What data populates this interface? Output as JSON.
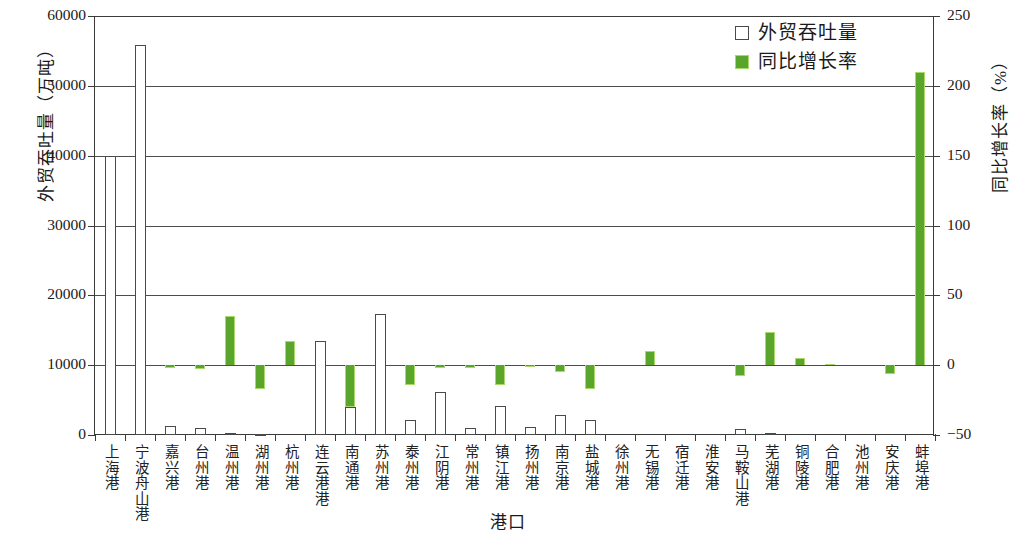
{
  "chart_data": {
    "type": "bar",
    "title": "",
    "xlabel": "港口",
    "ylabel": "外贸吞吐量（万吨）",
    "y2label": "同比增长率（%）",
    "ylim": [
      0,
      60000
    ],
    "y2lim": [
      -50,
      250
    ],
    "yticks": [
      "0",
      "10000",
      "20000",
      "30000",
      "40000",
      "50000",
      "60000"
    ],
    "y2ticks": [
      "-50",
      "0",
      "50",
      "100",
      "150",
      "200",
      "250"
    ],
    "grid": true,
    "legend_position": "top-right",
    "categories": [
      "上海港",
      "宁波舟山港",
      "嘉兴港",
      "台州港",
      "温州港",
      "湖州港",
      "杭州港",
      "连云港港",
      "南通港",
      "苏州港",
      "泰州港",
      "江阴港",
      "常州港",
      "镇江港",
      "扬州港",
      "南京港",
      "盐城港",
      "徐州港",
      "无锡港",
      "宿迁港",
      "淮安港",
      "马鞍山港",
      "芜湖港",
      "铜陵港",
      "合肥港",
      "池州港",
      "安庆港",
      "蚌埠港"
    ],
    "series": [
      {
        "name": "外贸吞吐量",
        "axis": "left",
        "unit": "万吨",
        "color": "#ffffff",
        "edge_color": "#4a4a4a",
        "values": [
          40000,
          55800,
          1300,
          1000,
          300,
          100,
          0,
          13500,
          4000,
          17300,
          2200,
          6200,
          1000,
          4100,
          1200,
          2900,
          2100,
          0,
          0,
          0,
          0,
          900,
          250,
          0,
          0,
          0,
          0,
          0
        ]
      },
      {
        "name": "同比增长率",
        "axis": "right",
        "unit": "%",
        "color": "#5aa52b",
        "edge_color": "#a8d96a",
        "values": [
          -3,
          0,
          -2,
          -3,
          35,
          -17,
          17,
          -2,
          -30,
          0,
          -14,
          -2,
          -2,
          -14,
          -1,
          -5,
          -17,
          0,
          10,
          0,
          0,
          -8,
          24,
          5,
          1,
          0,
          -6,
          210
        ]
      }
    ]
  },
  "legend": {
    "items": [
      {
        "label": "外贸吞吐量",
        "marker": "hollow-square"
      },
      {
        "label": "同比增长率",
        "marker": "filled-square"
      }
    ]
  }
}
